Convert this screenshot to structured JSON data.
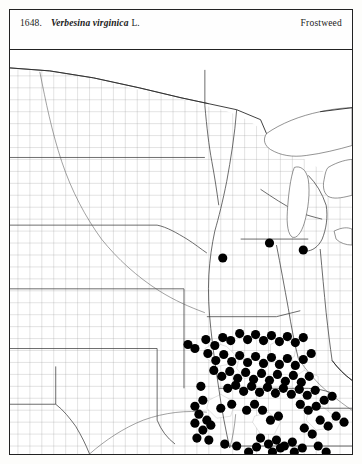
{
  "page": {
    "entry_number": "1648.",
    "scientific_name": "Verbesina virginica",
    "authority": "L.",
    "common_name": "Frostweed"
  },
  "map": {
    "title": "Verbesina virginica L. county distribution map",
    "region": "Central and eastern United States",
    "symbol": "filled-circle",
    "symbol_meaning": "county record",
    "dot_color": "#000000",
    "county_line_color": "#9a9a9a",
    "state_line_color": "#3a3a3a"
  },
  "chart_data": {
    "type": "scatter",
    "xlabel": "",
    "ylabel": "",
    "xlim": [
      0,
      344
    ],
    "ylim": [
      0,
      406
    ],
    "grid": false,
    "legend": "none",
    "point_radius": 4.6,
    "point_count": 99,
    "points": [
      [
        214,
        209
      ],
      [
        261,
        194
      ],
      [
        295,
        201
      ],
      [
        186,
        300
      ],
      [
        197,
        291
      ],
      [
        206,
        297
      ],
      [
        214,
        289
      ],
      [
        222,
        292
      ],
      [
        231,
        285
      ],
      [
        239,
        291
      ],
      [
        247,
        286
      ],
      [
        255,
        292
      ],
      [
        263,
        287
      ],
      [
        271,
        293
      ],
      [
        279,
        288
      ],
      [
        287,
        294
      ],
      [
        295,
        289
      ],
      [
        199,
        305
      ],
      [
        207,
        312
      ],
      [
        215,
        306
      ],
      [
        223,
        313
      ],
      [
        231,
        307
      ],
      [
        239,
        314
      ],
      [
        247,
        308
      ],
      [
        255,
        315
      ],
      [
        263,
        309
      ],
      [
        271,
        316
      ],
      [
        279,
        310
      ],
      [
        287,
        317
      ],
      [
        295,
        311
      ],
      [
        303,
        305
      ],
      [
        205,
        322
      ],
      [
        213,
        328
      ],
      [
        221,
        323
      ],
      [
        229,
        330
      ],
      [
        237,
        324
      ],
      [
        245,
        331
      ],
      [
        253,
        325
      ],
      [
        261,
        332
      ],
      [
        269,
        326
      ],
      [
        277,
        333
      ],
      [
        285,
        327
      ],
      [
        293,
        334
      ],
      [
        301,
        328
      ],
      [
        219,
        340
      ],
      [
        227,
        337
      ],
      [
        235,
        343
      ],
      [
        243,
        338
      ],
      [
        251,
        344
      ],
      [
        259,
        339
      ],
      [
        267,
        345
      ],
      [
        275,
        340
      ],
      [
        283,
        346
      ],
      [
        291,
        341
      ],
      [
        299,
        347
      ],
      [
        307,
        342
      ],
      [
        179,
        296
      ],
      [
        192,
        338
      ],
      [
        186,
        358
      ],
      [
        194,
        352
      ],
      [
        190,
        366
      ],
      [
        198,
        372
      ],
      [
        186,
        375
      ],
      [
        194,
        382
      ],
      [
        202,
        377
      ],
      [
        188,
        390
      ],
      [
        200,
        392
      ],
      [
        212,
        360
      ],
      [
        223,
        356
      ],
      [
        238,
        362
      ],
      [
        216,
        396
      ],
      [
        228,
        398
      ],
      [
        246,
        356
      ],
      [
        254,
        362
      ],
      [
        262,
        372
      ],
      [
        270,
        368
      ],
      [
        252,
        390
      ],
      [
        260,
        396
      ],
      [
        268,
        392
      ],
      [
        276,
        398
      ],
      [
        284,
        394
      ],
      [
        292,
        356
      ],
      [
        300,
        362
      ],
      [
        308,
        358
      ],
      [
        316,
        352
      ],
      [
        324,
        348
      ],
      [
        312,
        372
      ],
      [
        320,
        378
      ],
      [
        296,
        380
      ],
      [
        304,
        386
      ],
      [
        286,
        404
      ],
      [
        294,
        400
      ],
      [
        310,
        398
      ],
      [
        318,
        404
      ],
      [
        328,
        368
      ],
      [
        336,
        374
      ],
      [
        264,
        404
      ],
      [
        272,
        400
      ],
      [
        240,
        404
      ],
      [
        248,
        399
      ]
    ]
  }
}
